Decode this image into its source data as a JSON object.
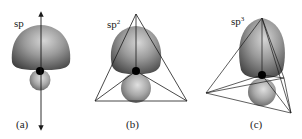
{
  "diagram": {
    "panels": [
      {
        "id": "a",
        "hybridization": "sp",
        "superscript": "",
        "caption": "(a)",
        "geometry": "linear"
      },
      {
        "id": "b",
        "hybridization": "sp",
        "superscript": "2",
        "caption": "(b)",
        "geometry": "trigonal-planar"
      },
      {
        "id": "c",
        "hybridization": "sp",
        "superscript": "3",
        "caption": "(c)",
        "geometry": "tetrahedral"
      }
    ],
    "colors": {
      "lobe_light": "#c8c8c8",
      "lobe_dark": "#4a4a4a",
      "nucleus": "#000000",
      "line": "#1a1a1a",
      "background": "#ffffff"
    }
  }
}
